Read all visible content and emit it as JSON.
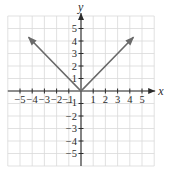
{
  "chart_data": {
    "type": "line",
    "title": "",
    "function": "y = |x|",
    "xlabel": "x",
    "ylabel": "y",
    "xlim": [
      -6,
      6
    ],
    "ylim": [
      -6,
      6
    ],
    "grid": true,
    "x_ticks": [
      -5,
      -4,
      -3,
      -2,
      -1,
      1,
      2,
      3,
      4,
      5
    ],
    "y_ticks": [
      -5,
      -4,
      -3,
      -2,
      -1,
      1,
      2,
      3,
      4,
      5
    ],
    "x_tick_labels": [
      "−5",
      "−4",
      "−3",
      "−2",
      "−1",
      "1",
      "2",
      "3",
      "4",
      "5"
    ],
    "y_tick_labels": [
      "−5",
      "−4",
      "−3",
      "−2",
      "−1",
      "1",
      "2",
      "3",
      "4",
      "5"
    ],
    "series": [
      {
        "name": "y = |x|",
        "x": [
          -4.3,
          0,
          4.3
        ],
        "y": [
          4.3,
          0,
          4.3
        ],
        "arrows": [
          "start",
          "end"
        ],
        "color": "#6a6a6a"
      }
    ],
    "colors": {
      "grid": "#d9d9d9",
      "axis": "#2b2b2b",
      "curve": "#6a6a6a"
    }
  }
}
